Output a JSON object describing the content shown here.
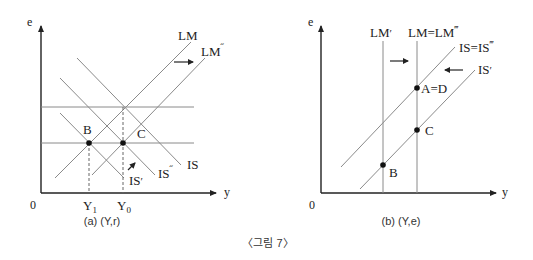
{
  "figure": {
    "caption": "〈그림 7〉"
  },
  "panel_a": {
    "subtitle": "(a) (Y,r)",
    "y_axis_label": "e",
    "x_axis_label": "y",
    "origin_label": "0",
    "x_ticks": {
      "y1": "Y",
      "y1_sub": "1",
      "y0": "Y",
      "y0_sub": "0"
    },
    "curves": {
      "lm": "LM",
      "lm2": "LM",
      "lm2_prime": "˝",
      "is": "IS",
      "is2": "IS",
      "is2_prime": "˝",
      "is1": "IS",
      "is1_prime": "′"
    },
    "points": {
      "b": "B",
      "c": "C"
    }
  },
  "panel_b": {
    "subtitle": "(b) (Y,e)",
    "y_axis_label": "e",
    "x_axis_label": "y",
    "origin_label": "0",
    "curves": {
      "lm1": "LM",
      "lm1_prime": "′",
      "lm_eq": "LM=LM",
      "lm_eq_prime": "‴",
      "is_eq": "IS=IS",
      "is_eq_prime": "‴",
      "is1": "IS",
      "is1_prime": "′"
    },
    "points": {
      "ad": "A=D",
      "c": "C",
      "b": "B"
    }
  }
}
